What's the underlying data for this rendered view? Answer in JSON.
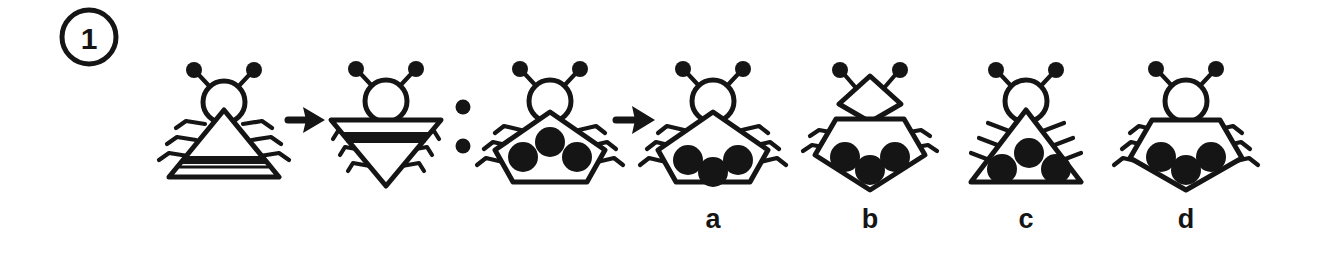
{
  "page": {
    "kind": "visual-analogy-puzzle",
    "background_color": "#ffffff",
    "ink_color": "#151515",
    "width": 1323,
    "height": 267
  },
  "item_number": {
    "label": "1",
    "shape": "circle"
  },
  "separators": {
    "arrow_1": "→",
    "colon": ":",
    "arrow_2": "→"
  },
  "prompt": {
    "term_a": {
      "name": "striped-triangle-bug",
      "body": "triangle-up",
      "head": "circle",
      "antennae": 2,
      "legs_per_side": 3,
      "leg_style": "bent",
      "marking": "black-band-near-base",
      "dots": 0
    },
    "term_b": {
      "name": "striped-inverted-triangle-bug",
      "body": "triangle-down",
      "head": "circle",
      "antennae": 2,
      "legs_per_side": 3,
      "leg_style": "bent",
      "marking": "black-band-near-top",
      "dots": 0
    },
    "term_c": {
      "name": "dotted-pentagon-bug",
      "body": "pentagon-up",
      "head": "circle",
      "antennae": 2,
      "legs_per_side": 3,
      "leg_style": "bent",
      "marking": "three-black-dots-upper",
      "dots": 3
    }
  },
  "options": [
    {
      "label": "a",
      "name": "option-a",
      "body": "pentagon-up",
      "head": "circle",
      "antennae": 2,
      "legs_per_side": 3,
      "leg_style": "bent",
      "dots": 3,
      "dot_arrangement": "two-up-one-down-lower"
    },
    {
      "label": "b",
      "name": "option-b",
      "body": "pentagon-up",
      "head": "diamond",
      "antennae": 2,
      "legs_per_side": 2,
      "leg_style": "straight",
      "dots": 3,
      "dot_arrangement": "two-up-one-down-lower"
    },
    {
      "label": "c",
      "name": "option-c",
      "body": "triangle-up",
      "head": "circle",
      "antennae": 2,
      "legs_per_side": 3,
      "leg_style": "straight",
      "dots": 3,
      "dot_arrangement": "one-up-two-down"
    },
    {
      "label": "d",
      "name": "option-d",
      "body": "pentagon-down",
      "head": "circle",
      "antennae": 2,
      "legs_per_side": 3,
      "leg_style": "bent",
      "dots": 3,
      "dot_arrangement": "two-up-one-down"
    }
  ]
}
